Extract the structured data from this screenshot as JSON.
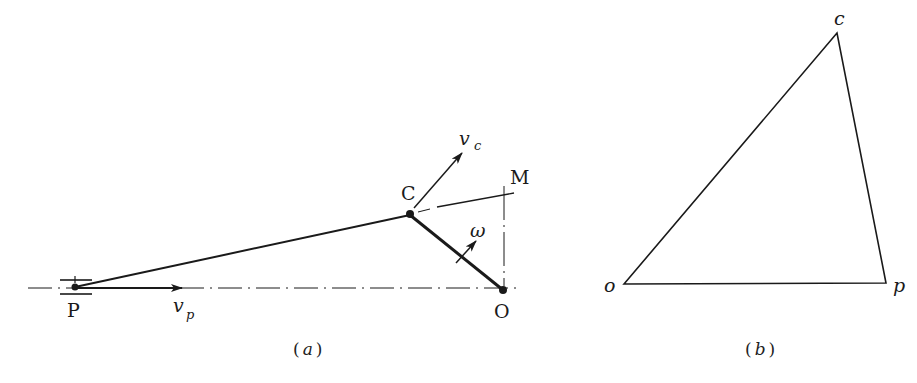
{
  "figure_a": {
    "caption_open": "(",
    "caption_letter": "a",
    "caption_close": ")",
    "labels": {
      "P": "P",
      "C": "C",
      "O": "O",
      "M": "M",
      "vp_main": "v",
      "vp_sub": "p",
      "vc_main": "v",
      "vc_sub": "c",
      "omega": "ω"
    },
    "points": {
      "P": [
        75,
        287
      ],
      "C": [
        410,
        215
      ],
      "O": [
        503,
        290
      ],
      "M": [
        505,
        192
      ]
    }
  },
  "figure_b": {
    "caption_open": "(",
    "caption_letter": "b",
    "caption_close": ")",
    "labels": {
      "o": "o",
      "c": "c",
      "p": "p"
    },
    "points": {
      "o": [
        624,
        284
      ],
      "c": [
        837,
        33
      ],
      "p": [
        886,
        283
      ]
    }
  },
  "colors": {
    "ink": "#1a1a1a",
    "background": "#ffffff"
  }
}
